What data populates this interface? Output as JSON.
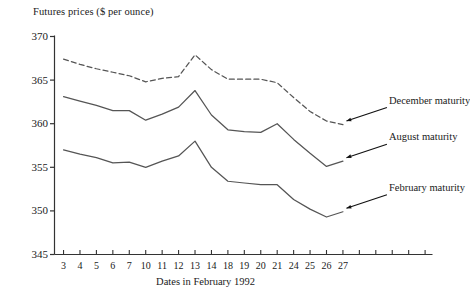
{
  "chart_data": {
    "type": "line",
    "title": "",
    "ylabel": "Futures prices ($ per ounce)",
    "xlabel": "Dates in February 1992",
    "grid": false,
    "legend_position": "inline-annotations",
    "ylim": [
      345,
      370
    ],
    "y_ticks": [
      "345",
      "350",
      "355",
      "360",
      "365",
      "370"
    ],
    "categories": [
      "3",
      "4",
      "5",
      "6",
      "7",
      "10",
      "11",
      "12",
      "13",
      "14",
      "18",
      "19",
      "20",
      "21",
      "24",
      "25",
      "26",
      "27"
    ],
    "extra_unlabeled_ticks": 5,
    "series": [
      {
        "name": "December maturity",
        "style": "dashed",
        "color": "#555555",
        "values": [
          367.4,
          366.8,
          366.3,
          365.9,
          365.5,
          364.8,
          365.2,
          365.4,
          367.9,
          366.2,
          365.1,
          365.1,
          365.1,
          364.7,
          363.0,
          361.4,
          360.3,
          359.9
        ]
      },
      {
        "name": "August maturity",
        "style": "solid",
        "color": "#555555",
        "values": [
          363.1,
          362.6,
          362.1,
          361.5,
          361.5,
          360.4,
          361.1,
          361.9,
          363.8,
          361.0,
          359.3,
          359.1,
          359.0,
          360.0,
          358.2,
          356.6,
          355.1,
          355.7
        ]
      },
      {
        "name": "February maturity",
        "style": "solid",
        "color": "#555555",
        "values": [
          357.0,
          356.5,
          356.1,
          355.5,
          355.6,
          355.0,
          355.7,
          356.3,
          358.0,
          355.0,
          353.4,
          353.2,
          353.0,
          353.0,
          351.3,
          350.2,
          349.3,
          349.9
        ]
      }
    ],
    "annotations": [
      {
        "text": "December maturity",
        "series": "December maturity"
      },
      {
        "text": "August maturity",
        "series": "August maturity"
      },
      {
        "text": "February maturity",
        "series": "February maturity"
      }
    ]
  }
}
